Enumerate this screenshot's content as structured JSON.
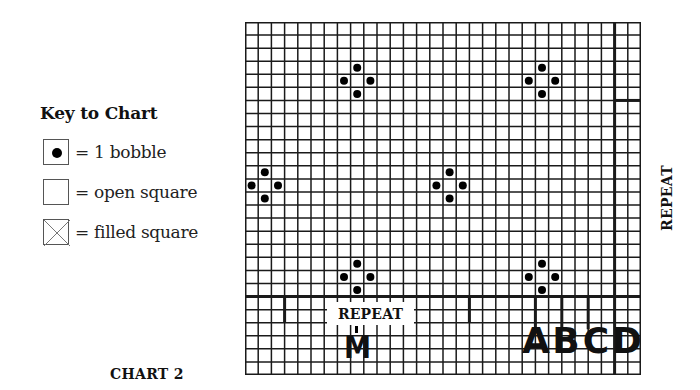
{
  "key": {
    "title": "Key to Chart",
    "items": [
      {
        "symbol": "bobble-icon",
        "label": "= 1 bobble"
      },
      {
        "symbol": "open-square-icon",
        "label": "= open square"
      },
      {
        "symbol": "filled-square-icon",
        "label": "= filled square"
      }
    ]
  },
  "chart": {
    "title": "CHART 2",
    "columns": 30,
    "rows": 27,
    "bobbles": [
      [
        3,
        8
      ],
      [
        4,
        7
      ],
      [
        4,
        9
      ],
      [
        5,
        8
      ],
      [
        3,
        22
      ],
      [
        4,
        21
      ],
      [
        4,
        23
      ],
      [
        5,
        22
      ],
      [
        11,
        1
      ],
      [
        12,
        0
      ],
      [
        12,
        2
      ],
      [
        13,
        1
      ],
      [
        11,
        15
      ],
      [
        12,
        14
      ],
      [
        12,
        16
      ],
      [
        13,
        15
      ],
      [
        18,
        8
      ],
      [
        19,
        7
      ],
      [
        19,
        9
      ],
      [
        20,
        8
      ],
      [
        18,
        22
      ],
      [
        19,
        21
      ],
      [
        19,
        23
      ],
      [
        20,
        22
      ]
    ],
    "repeat_horizontal_label": "REPEAT",
    "repeat_vertical_label": "REPEAT",
    "size_marker_m": "M",
    "size_markers": [
      "A",
      "B",
      "C",
      "D"
    ],
    "line_color": "#1a1a1a",
    "bobble_color": "#000000"
  }
}
